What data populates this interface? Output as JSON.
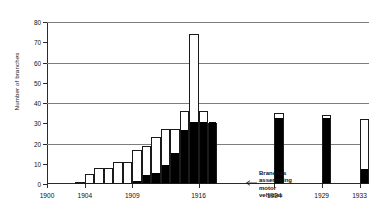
{
  "chart_data": {
    "type": "bar",
    "title": "",
    "subtitle": "",
    "xlabel": "",
    "ylabel": "Number of branches",
    "ylim": [
      0,
      80
    ],
    "xlim": [
      1900,
      1934
    ],
    "ytick_values": [
      0,
      10,
      20,
      30,
      40,
      50,
      60,
      70,
      80
    ],
    "ytick_labels": [
      "0",
      "10",
      "20",
      "30",
      "40",
      "50",
      "60",
      "70",
      "80"
    ],
    "gridlines_at": [
      20,
      40,
      60,
      80
    ],
    "grid": true,
    "xtick_values": [
      1900,
      1904,
      1909,
      1916,
      1924,
      1929,
      1933
    ],
    "xtick_labels": [
      "1900",
      "1904",
      "1909",
      "1916",
      "1924",
      "1929",
      "1933"
    ],
    "legend_position": "none",
    "stacked": true,
    "series": [
      {
        "name": "Total branches",
        "color": "#ffffff",
        "edge_color": "#1a1a1a"
      },
      {
        "name": "Branches assembling motor vehicles",
        "color": "#000000",
        "edge_color": "#000000"
      }
    ],
    "categories": [
      1903,
      1904,
      1905,
      1906,
      1907,
      1908,
      1909,
      1910,
      1911,
      1912,
      1913,
      1914,
      1915,
      1916,
      1917,
      1924,
      1929,
      1933
    ],
    "values_total": [
      1,
      5,
      8,
      8,
      11,
      11,
      17,
      19,
      23,
      27,
      27,
      36,
      74,
      36,
      30,
      35,
      34,
      32
    ],
    "values_assembling": [
      0,
      0,
      0,
      0,
      0,
      0,
      1,
      4,
      5,
      9,
      15,
      26,
      30,
      30,
      30,
      32,
      32,
      7
    ],
    "annotations": [
      {
        "text": "Branches assembling motor vehicles",
        "x": 1919,
        "y": 18,
        "arrow": true,
        "arrow_target_x": 1917,
        "arrow_target_y": 18
      }
    ]
  },
  "annotation": {
    "line1": "Branches",
    "line2": "assembling",
    "line3": "motor",
    "line4": "vehicles"
  }
}
